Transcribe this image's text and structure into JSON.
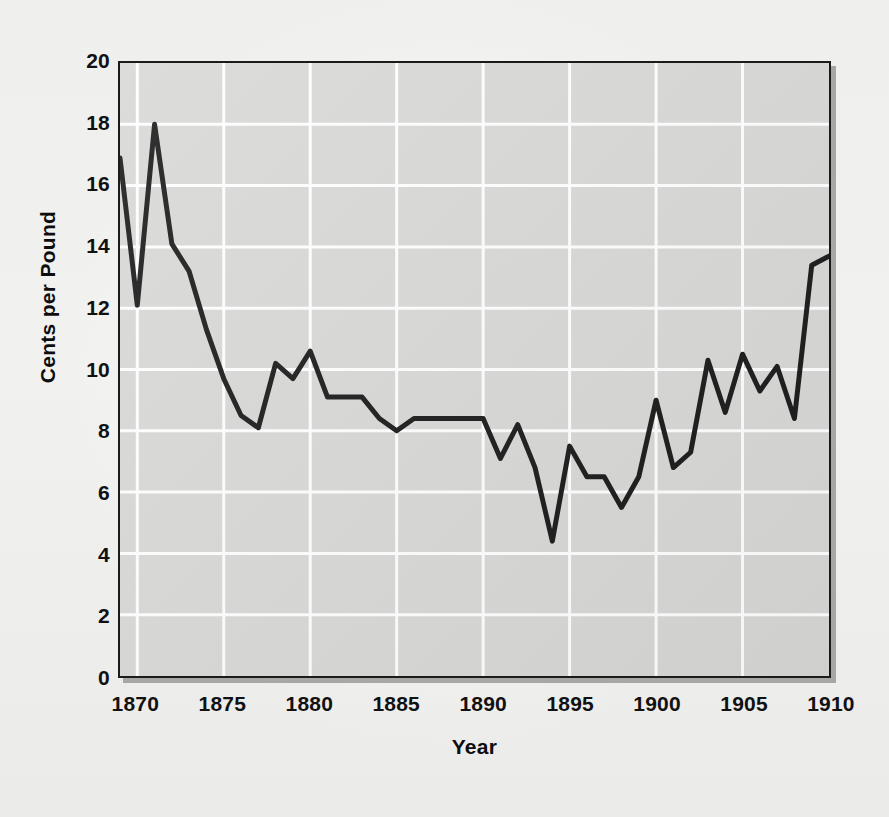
{
  "chart_data": {
    "type": "line",
    "title": "",
    "xlabel": "Year",
    "ylabel": "Cents per Pound",
    "xlim": [
      1869,
      1910
    ],
    "ylim": [
      0,
      20
    ],
    "xticks": [
      1870,
      1875,
      1880,
      1885,
      1890,
      1895,
      1900,
      1905,
      1910
    ],
    "yticks": [
      0,
      2,
      4,
      6,
      8,
      10,
      12,
      14,
      16,
      18,
      20
    ],
    "grid": true,
    "grid_color": "#ffffff",
    "legend": "none",
    "line_color": "#1a1a1a",
    "line_width": 5,
    "plot_background": "#d8d8d6",
    "figure_background": "#f0f0ee",
    "x": [
      1869,
      1870,
      1871,
      1872,
      1873,
      1874,
      1875,
      1876,
      1877,
      1878,
      1879,
      1880,
      1881,
      1882,
      1883,
      1884,
      1885,
      1886,
      1887,
      1888,
      1889,
      1890,
      1891,
      1892,
      1893,
      1894,
      1895,
      1896,
      1897,
      1898,
      1899,
      1900,
      1901,
      1902,
      1903,
      1904,
      1905,
      1906,
      1907,
      1908,
      1909,
      1910
    ],
    "values": [
      16.9,
      12.1,
      18.0,
      14.1,
      13.2,
      11.3,
      9.7,
      8.5,
      8.1,
      10.2,
      9.7,
      10.6,
      9.1,
      9.1,
      9.1,
      8.4,
      8.0,
      8.4,
      8.4,
      8.4,
      8.4,
      8.4,
      7.1,
      8.2,
      6.8,
      4.4,
      7.5,
      6.5,
      6.5,
      5.5,
      6.5,
      9.0,
      6.8,
      7.3,
      10.3,
      8.6,
      10.5,
      9.3,
      10.1,
      8.4,
      13.4,
      13.7
    ],
    "series_name": "Cotton price"
  }
}
